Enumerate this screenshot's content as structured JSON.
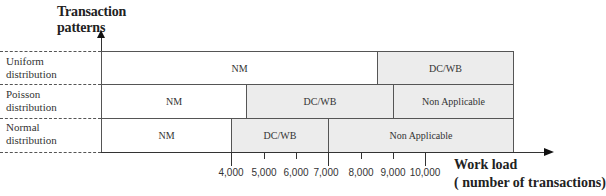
{
  "diagram": {
    "y_axis_title_line1": "Transaction",
    "y_axis_title_line2": "patterns",
    "x_axis_title_line1": "Work load",
    "x_axis_title_line2": "( number of transactions)",
    "rows": [
      {
        "label_line1": "Uniform",
        "label_line2": "distribution",
        "segments": [
          {
            "label": "NM",
            "from": 0,
            "to": 8500,
            "fill": "white"
          },
          {
            "label": "DC/WB",
            "from": 8500,
            "to": 12700,
            "fill": "grey"
          }
        ]
      },
      {
        "label_line1": "Poisson",
        "label_line2": "distribution",
        "segments": [
          {
            "label": "NM",
            "from": 0,
            "to": 4500,
            "fill": "white"
          },
          {
            "label": "DC/WB",
            "from": 4500,
            "to": 9000,
            "fill": "grey"
          },
          {
            "label": "Non Applicable",
            "from": 9000,
            "to": 12700,
            "fill": "grey"
          }
        ]
      },
      {
        "label_line1": "Normal",
        "label_line2": "distribution",
        "segments": [
          {
            "label": "NM",
            "from": 0,
            "to": 4000,
            "fill": "white"
          },
          {
            "label": "DC/WB",
            "from": 4000,
            "to": 7000,
            "fill": "grey"
          },
          {
            "label": "Non Applicable",
            "from": 7000,
            "to": 12700,
            "fill": "grey"
          }
        ]
      }
    ],
    "x_ticks": [
      "4,000",
      "5,000",
      "6,000",
      "7,000",
      "8,000",
      "9,000",
      "10,000"
    ],
    "colors": {
      "grey_fill": "#ececec",
      "white_fill": "#ffffff",
      "border": "#555555"
    }
  }
}
